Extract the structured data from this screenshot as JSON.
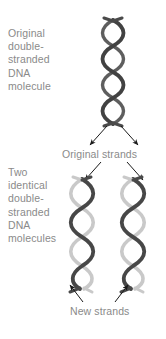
{
  "figure": {
    "background_color": "#ffffff",
    "text_color": "#8a8a8a",
    "strand_colors": {
      "original_dark": "#4a4a4a",
      "new_light": "#c9c9c9",
      "arrow": "#1a1a1a"
    }
  },
  "labels": {
    "original_molecule": "Original\ndouble-\nstranded\nDNA\nmolecule",
    "two_molecules": "Two\nidentical\ndouble-\nstranded\nDNA\nmolecules",
    "original_strands": "Original strands",
    "new_strands": "New strands"
  },
  "diagram": {
    "top_helix": {
      "name": "original double-stranded DNA molecule",
      "strand_a_color": "#4a4a4a",
      "strand_b_color": "#4a4a4a",
      "center_x": 113,
      "top_y": 20,
      "bottom_y": 122
    },
    "bottom_left_helix": {
      "name": "daughter DNA molecule left",
      "strand_a_color": "#4a4a4a",
      "strand_b_color": "#c9c9c9",
      "center_x": 82,
      "top_y": 178,
      "bottom_y": 290
    },
    "bottom_right_helix": {
      "name": "daughter DNA molecule right",
      "strand_a_color": "#4a4a4a",
      "strand_b_color": "#c9c9c9",
      "center_x": 133,
      "top_y": 178,
      "bottom_y": 290
    },
    "arrows": [
      {
        "name": "split-arrow-left",
        "from": [
          106,
          124
        ],
        "to": [
          88,
          146
        ]
      },
      {
        "name": "split-arrow-right",
        "from": [
          122,
          124
        ],
        "to": [
          140,
          146
        ]
      },
      {
        "name": "original-strands-pointer-left",
        "from": [
          100,
          162
        ],
        "to": [
          84,
          180
        ]
      },
      {
        "name": "original-strands-pointer-right",
        "from": [
          126,
          162
        ],
        "to": [
          142,
          180
        ]
      },
      {
        "name": "new-strands-pointer-left",
        "from": [
          82,
          302
        ],
        "to": [
          70,
          286
        ]
      },
      {
        "name": "new-strands-pointer-right",
        "from": [
          116,
          302
        ],
        "to": [
          130,
          286
        ]
      }
    ]
  }
}
